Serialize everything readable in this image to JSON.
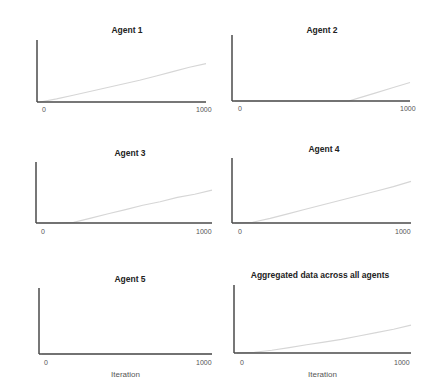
{
  "chart_data": [
    {
      "type": "line",
      "title": "Agent 1",
      "xlabel": "",
      "ylabel": "",
      "xlim": [
        0,
        1000
      ],
      "ylim": [
        0,
        5000
      ],
      "x_ticks": [
        "0",
        "1000"
      ],
      "y_ticks": [
        "0",
        "5000"
      ],
      "grid": false,
      "x": [
        0,
        100,
        200,
        300,
        400,
        500,
        600,
        700,
        800,
        900,
        1000
      ],
      "values": [
        0,
        250,
        550,
        850,
        1150,
        1450,
        1750,
        2100,
        2450,
        2800,
        3100
      ]
    },
    {
      "type": "line",
      "title": "Agent 2",
      "xlabel": "",
      "ylabel": "",
      "xlim": [
        0,
        1000
      ],
      "ylim": [
        0,
        5000
      ],
      "x_ticks": [
        "0",
        "1000"
      ],
      "y_ticks": [
        "0",
        "5000"
      ],
      "grid": false,
      "x": [
        0,
        100,
        200,
        300,
        400,
        500,
        600,
        650,
        700,
        800,
        900,
        1000
      ],
      "values": [
        0,
        0,
        0,
        0,
        0,
        0,
        0,
        0,
        200,
        600,
        1000,
        1400
      ]
    },
    {
      "type": "line",
      "title": "Agent 3",
      "xlabel": "",
      "ylabel": "",
      "xlim": [
        0,
        1000
      ],
      "ylim": [
        0,
        5000
      ],
      "x_ticks": [
        "0",
        "1000"
      ],
      "y_ticks": [
        "0",
        "5000"
      ],
      "grid": false,
      "x": [
        0,
        100,
        200,
        300,
        400,
        500,
        600,
        700,
        800,
        900,
        1000
      ],
      "values": [
        0,
        0,
        50,
        400,
        750,
        1100,
        1450,
        1750,
        2100,
        2350,
        2700
      ]
    },
    {
      "type": "line",
      "title": "Agent 4",
      "xlabel": "",
      "ylabel": "",
      "xlim": [
        0,
        1000
      ],
      "ylim": [
        0,
        5000
      ],
      "x_ticks": [
        "0",
        "1000"
      ],
      "y_ticks": [
        "0",
        "5000"
      ],
      "grid": false,
      "x": [
        0,
        100,
        200,
        300,
        400,
        500,
        600,
        700,
        800,
        900,
        1000
      ],
      "values": [
        0,
        50,
        350,
        700,
        1050,
        1400,
        1750,
        2100,
        2450,
        2800,
        3200
      ]
    },
    {
      "type": "line",
      "title": "Agent 5",
      "xlabel": "Iteration",
      "ylabel": "",
      "xlim": [
        0,
        1000
      ],
      "ylim": [
        0,
        5000
      ],
      "x_ticks": [
        "0",
        "1000"
      ],
      "y_ticks": [
        "0",
        "5000"
      ],
      "grid": false,
      "x": [
        0,
        1000
      ],
      "values": [
        0,
        0
      ]
    },
    {
      "type": "line",
      "title": "Aggregated data across all agents",
      "xlabel": "Iteration",
      "ylabel": "",
      "xlim": [
        0,
        1000
      ],
      "ylim": [
        0,
        5000
      ],
      "x_ticks": [
        "0",
        "1000"
      ],
      "y_ticks": [
        "0",
        "5000"
      ],
      "grid": false,
      "x": [
        0,
        100,
        200,
        300,
        400,
        500,
        600,
        700,
        800,
        900,
        1000
      ],
      "values": [
        0,
        50,
        200,
        400,
        600,
        800,
        1000,
        1250,
        1500,
        1750,
        2050
      ]
    }
  ],
  "style": {
    "axis_color": "#4a4a4a",
    "line_color": "#d6d6d6"
  }
}
